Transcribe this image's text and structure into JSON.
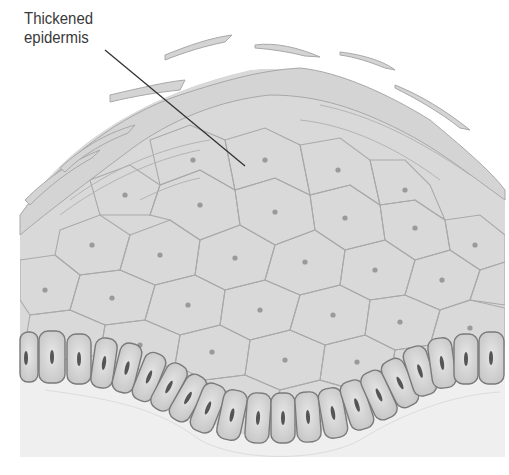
{
  "figure": {
    "labels": [
      {
        "text": "Thickened\nepidermis",
        "pointer_from": [
          105,
          50
        ],
        "pointer_to": [
          245,
          166
        ]
      }
    ],
    "colors": {
      "background": "#ffffff",
      "tissue_fill": "#d9d9d9",
      "cell_border": "#a9a9a9",
      "nucleus": "#9a9a9a",
      "basal_fill": "#d3d3d3",
      "basal_border": "#7a7a7a",
      "basal_nucleus": "#555555",
      "dermis_fill": "#efefef",
      "label_text": "#3a3a3a",
      "leader_line": "#333333"
    }
  }
}
